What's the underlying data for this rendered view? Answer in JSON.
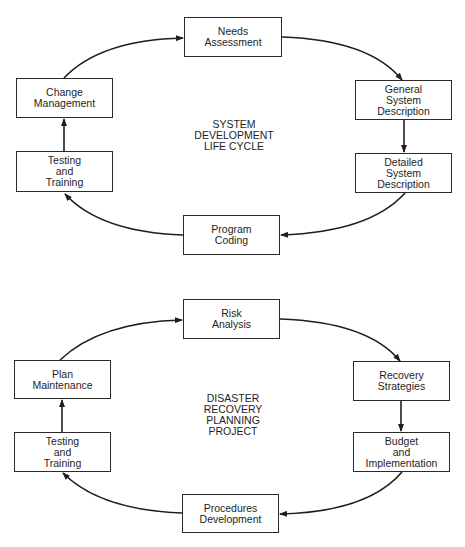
{
  "diagrams": [
    {
      "title_lines": [
        "SYSTEM",
        "DEVELOPMENT",
        "LIFE CYCLE"
      ],
      "nodes": [
        {
          "id": "needs-assessment",
          "lines": [
            "Needs",
            "Assessment"
          ]
        },
        {
          "id": "general-system-description",
          "lines": [
            "General",
            "System",
            "Description"
          ]
        },
        {
          "id": "detailed-system-description",
          "lines": [
            "Detailed",
            "System",
            "Description"
          ]
        },
        {
          "id": "program-coding",
          "lines": [
            "Program",
            "Coding"
          ]
        },
        {
          "id": "testing-and-training",
          "lines": [
            "Testing",
            "and",
            "Training"
          ]
        },
        {
          "id": "change-management",
          "lines": [
            "Change",
            "Management"
          ]
        }
      ]
    },
    {
      "title_lines": [
        "DISASTER",
        "RECOVERY",
        "PLANNING",
        "PROJECT"
      ],
      "nodes": [
        {
          "id": "risk-analysis",
          "lines": [
            "Risk",
            "Analysis"
          ]
        },
        {
          "id": "recovery-strategies",
          "lines": [
            "Recovery",
            "Strategies"
          ]
        },
        {
          "id": "budget-and-implementation",
          "lines": [
            "Budget",
            "and",
            "Implementation"
          ]
        },
        {
          "id": "procedures-development",
          "lines": [
            "Procedures",
            "Development"
          ]
        },
        {
          "id": "testing-and-training",
          "lines": [
            "Testing",
            "and",
            "Training"
          ]
        },
        {
          "id": "plan-maintenance",
          "lines": [
            "Plan",
            "Maintenance"
          ]
        }
      ]
    }
  ],
  "colors": {
    "line": "#1e1e1e",
    "box_border": "#2a2a2a",
    "background": "#ffffff"
  }
}
